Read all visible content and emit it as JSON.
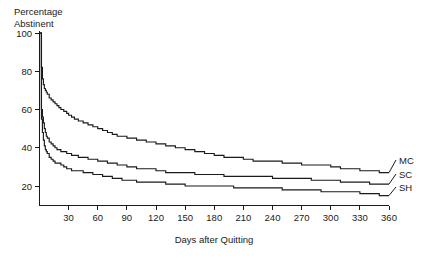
{
  "chart_data": {
    "type": "line",
    "title": "",
    "xlabel": "Days after Quitting",
    "ylabel": "Percentage Abstinent",
    "ylabel_line1": "Percentage",
    "ylabel_line2": "Abstinent",
    "xlim": [
      0,
      360
    ],
    "ylim": [
      0,
      100
    ],
    "xticks": [
      30,
      60,
      90,
      120,
      150,
      180,
      210,
      240,
      270,
      300,
      330,
      360
    ],
    "xtick_labels": [
      "30",
      "60",
      "90",
      "120",
      "150",
      "180",
      "210",
      "240",
      "270",
      "300",
      "330",
      "360"
    ],
    "yticks": [
      20,
      40,
      60,
      80,
      100
    ],
    "ytick_labels": [
      "20",
      "40",
      "60",
      "80",
      "100"
    ],
    "grid": false,
    "legend_position": "right-inline-labels",
    "curve_style": "step",
    "series": [
      {
        "name": "MC",
        "label": "MC",
        "color": "#1a1a1a",
        "x": [
          0,
          2,
          3,
          4,
          5,
          6,
          7,
          8,
          10,
          12,
          14,
          16,
          18,
          20,
          22,
          25,
          28,
          30,
          33,
          36,
          40,
          45,
          50,
          55,
          60,
          65,
          70,
          75,
          80,
          85,
          90,
          95,
          100,
          110,
          120,
          130,
          140,
          150,
          160,
          170,
          180,
          190,
          200,
          210,
          220,
          230,
          240,
          250,
          260,
          270,
          280,
          290,
          300,
          310,
          320,
          330,
          340,
          350,
          360
        ],
        "values": [
          100,
          82,
          76,
          73,
          71,
          70,
          69,
          68,
          66,
          65,
          64,
          63,
          62,
          61,
          60,
          59,
          58,
          57,
          56,
          55,
          54,
          53,
          52,
          51,
          50,
          49,
          48,
          47,
          46,
          46,
          45,
          45,
          44,
          43,
          42,
          41,
          40,
          39,
          38,
          37,
          36,
          35,
          35,
          34,
          33,
          33,
          33,
          32,
          32,
          31,
          31,
          31,
          30,
          29,
          29,
          28,
          28,
          27,
          27
        ]
      },
      {
        "name": "SC",
        "label": "SC",
        "color": "#1a1a1a",
        "x": [
          0,
          2,
          3,
          4,
          5,
          6,
          7,
          8,
          10,
          12,
          14,
          16,
          18,
          20,
          22,
          25,
          28,
          30,
          33,
          36,
          40,
          45,
          50,
          55,
          60,
          65,
          70,
          75,
          80,
          85,
          90,
          95,
          100,
          110,
          120,
          130,
          140,
          150,
          160,
          170,
          180,
          190,
          200,
          210,
          220,
          230,
          240,
          250,
          260,
          270,
          280,
          290,
          300,
          310,
          320,
          330,
          340,
          350,
          360
        ],
        "values": [
          100,
          60,
          56,
          53,
          50,
          48,
          46,
          45,
          43,
          42,
          41,
          40,
          39,
          39,
          38,
          38,
          37,
          37,
          36,
          36,
          35,
          35,
          34,
          34,
          33,
          33,
          32,
          32,
          31,
          31,
          30,
          30,
          29,
          29,
          28,
          27,
          27,
          27,
          26,
          26,
          26,
          25,
          25,
          25,
          25,
          25,
          24,
          24,
          24,
          24,
          23,
          23,
          23,
          22,
          22,
          22,
          21,
          21,
          21
        ]
      },
      {
        "name": "SH",
        "label": "SH",
        "color": "#1a1a1a",
        "x": [
          0,
          2,
          3,
          4,
          5,
          6,
          7,
          8,
          10,
          12,
          14,
          16,
          18,
          20,
          22,
          25,
          28,
          30,
          33,
          36,
          40,
          45,
          50,
          55,
          60,
          65,
          70,
          75,
          80,
          85,
          90,
          95,
          100,
          110,
          120,
          130,
          140,
          150,
          160,
          170,
          180,
          190,
          200,
          210,
          220,
          230,
          240,
          250,
          260,
          270,
          280,
          290,
          300,
          310,
          320,
          330,
          340,
          350,
          360
        ],
        "values": [
          100,
          55,
          48,
          44,
          41,
          39,
          38,
          37,
          35,
          34,
          33,
          32,
          32,
          32,
          31,
          30,
          29,
          29,
          28,
          28,
          28,
          27,
          27,
          26,
          26,
          25,
          25,
          24,
          24,
          23,
          23,
          23,
          22,
          22,
          22,
          21,
          21,
          20,
          20,
          20,
          20,
          20,
          19,
          19,
          19,
          19,
          19,
          18,
          18,
          18,
          18,
          17,
          17,
          17,
          17,
          16,
          16,
          15,
          15
        ]
      }
    ]
  }
}
